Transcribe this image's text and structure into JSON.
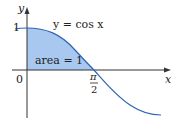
{
  "figure": {
    "y_axis_label": "y",
    "x_axis_label": "x",
    "curve_label": "y = cos x",
    "area_label": "area = 1",
    "tick_y_one": "1",
    "origin_label": "0",
    "tick_x_pi": "π",
    "tick_x_two": "2",
    "colors": {
      "fill": "#a9c8ef",
      "curve": "#2e64b5",
      "axis": "#333333"
    }
  }
}
